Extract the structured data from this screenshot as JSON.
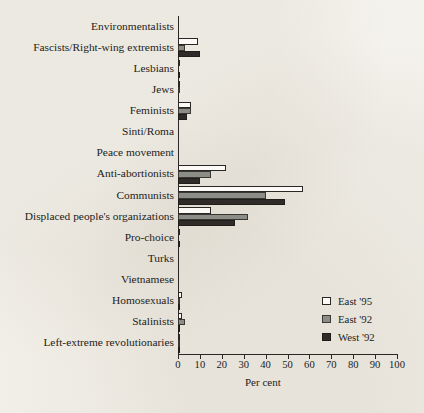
{
  "chart_data": {
    "type": "bar",
    "orientation": "horizontal",
    "title": "",
    "subtitle": "",
    "xlabel": "Per cent",
    "ylabel": "",
    "xlim": [
      0,
      100
    ],
    "xticks": [
      0,
      10,
      20,
      30,
      40,
      50,
      60,
      70,
      80,
      90,
      100
    ],
    "xtick_labels": [
      "0",
      "10",
      "20",
      "30",
      "40",
      "50",
      "60",
      "70",
      "80",
      "90",
      "100"
    ],
    "grid": false,
    "legend_position": "right-lower",
    "categories": [
      "Environmentalists",
      "Fascists/Right-wing extremists",
      "Lesbians",
      "Jews",
      "Feminists",
      "Sinti/Roma",
      "Peace movement",
      "Anti-abortionists",
      "Communists",
      "Displaced people's organizations",
      "Pro-choice",
      "Turks",
      "Vietnamese",
      "Homosexuals",
      "Stalinists",
      "Left-extreme revolutionaries"
    ],
    "series": [
      {
        "name": "East '95",
        "color": "#fbfaf6",
        "edge_color": "#2b2724",
        "values": [
          0,
          9,
          1,
          1,
          6,
          0,
          0,
          22,
          57,
          15,
          1,
          0,
          0,
          2,
          2,
          1
        ]
      },
      {
        "name": "East '92",
        "color": "#8d8d88",
        "edge_color": "#3a3834",
        "values": [
          0,
          3,
          0,
          1,
          6,
          0,
          0,
          15,
          40,
          32,
          0,
          0,
          0,
          1,
          3,
          1
        ]
      },
      {
        "name": "West '92",
        "color": "#2e2b28",
        "edge_color": "#201e1b",
        "values": [
          0,
          10,
          1,
          0,
          4,
          0,
          0,
          10,
          49,
          26,
          1,
          0,
          0,
          1,
          1,
          1
        ]
      }
    ]
  },
  "legend": {
    "entries": [
      {
        "label": "East '95",
        "swatch": "white-square-swatch"
      },
      {
        "label": "East '92",
        "swatch": "gray-square-swatch"
      },
      {
        "label": "West '92",
        "swatch": "black-square-swatch"
      }
    ]
  },
  "axis": {
    "x_title": "Per cent"
  }
}
